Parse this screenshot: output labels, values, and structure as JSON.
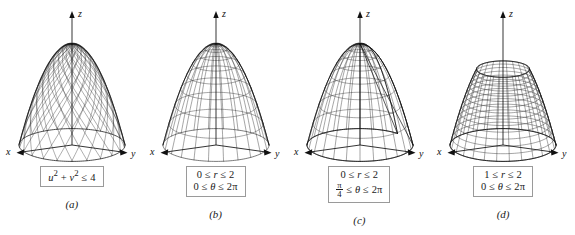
{
  "figure": {
    "background_color": "#ffffff",
    "ink_color": "#1a1a1a",
    "box_border_color": "#9a9a9a"
  },
  "axes": {
    "x_label": "x",
    "y_label": "y",
    "z_label": "z"
  },
  "panels": [
    {
      "id": "a",
      "label": "(a)",
      "surface": "paraboloid dome with diagonal criss-cross mesh, closed top",
      "domain_lines": [
        {
          "parts": [
            {
              "t": "u",
              "style": "italic"
            },
            {
              "t": "2",
              "style": "sup"
            },
            {
              "t": " + ",
              "style": "plain"
            },
            {
              "t": "v",
              "style": "italic"
            },
            {
              "t": "2",
              "style": "sup"
            },
            {
              "t": " ≤ 4",
              "style": "plain"
            }
          ],
          "text": "u² + v² ≤ 4"
        }
      ]
    },
    {
      "id": "b",
      "label": "(b)",
      "surface": "paraboloid dome with rectangular polar grid mesh, closed top",
      "domain_lines": [
        {
          "parts": [
            {
              "t": "0 ≤ ",
              "style": "plain"
            },
            {
              "t": "r",
              "style": "italic"
            },
            {
              "t": " ≤ 2",
              "style": "plain"
            }
          ],
          "text": "0 ≤ r ≤ 2"
        },
        {
          "parts": [
            {
              "t": "0 ≤ ",
              "style": "plain"
            },
            {
              "t": "θ",
              "style": "italic"
            },
            {
              "t": " ≤ 2π",
              "style": "plain"
            }
          ],
          "text": "0 ≤ θ ≤ 2π"
        }
      ]
    },
    {
      "id": "c",
      "label": "(c)",
      "surface": "paraboloid dome with wedge cut out between theta = pi/4 and 2pi, interior visible",
      "domain_lines": [
        {
          "parts": [
            {
              "t": "0 ≤ ",
              "style": "plain"
            },
            {
              "t": "r",
              "style": "italic"
            },
            {
              "t": " ≤ 2",
              "style": "plain"
            }
          ],
          "text": "0 ≤ r ≤ 2"
        },
        {
          "fraction": {
            "num": "π",
            "den": "4"
          },
          "parts": [
            {
              "t": " ≤ ",
              "style": "plain"
            },
            {
              "t": "θ",
              "style": "italic"
            },
            {
              "t": " ≤ 2π",
              "style": "plain"
            }
          ],
          "text": "π/4 ≤ θ ≤ 2π"
        }
      ]
    },
    {
      "id": "d",
      "label": "(d)",
      "surface": "truncated paraboloid annulus with open hole at top, 1 ≤ r ≤ 2",
      "domain_lines": [
        {
          "parts": [
            {
              "t": "1 ≤ ",
              "style": "plain"
            },
            {
              "t": "r",
              "style": "italic"
            },
            {
              "t": " ≤ 2",
              "style": "plain"
            }
          ],
          "text": "1 ≤ r ≤ 2"
        },
        {
          "parts": [
            {
              "t": "0 ≤ ",
              "style": "plain"
            },
            {
              "t": "θ",
              "style": "italic"
            },
            {
              "t": " ≤ 2π",
              "style": "plain"
            }
          ],
          "text": "0 ≤ θ ≤ 2π"
        }
      ]
    }
  ],
  "chart_data": {
    "type": "line",
    "xlabel": "x",
    "ylabel": "y",
    "zlabel": "z",
    "surface_equation": "z = 4 - r²",
    "panels": [
      {
        "id": "a",
        "r_min": 0,
        "r_max": 2,
        "theta_min_deg": 0,
        "theta_max_deg": 360,
        "mesh": "diagonal",
        "domain_text": "u² + v² ≤ 4"
      },
      {
        "id": "b",
        "r_min": 0,
        "r_max": 2,
        "theta_min_deg": 0,
        "theta_max_deg": 360,
        "mesh": "polar-grid",
        "domain_text": "0 ≤ r ≤ 2 ; 0 ≤ θ ≤ 2π"
      },
      {
        "id": "c",
        "r_min": 0,
        "r_max": 2,
        "theta_min_deg": 45,
        "theta_max_deg": 360,
        "mesh": "polar-grid",
        "domain_text": "0 ≤ r ≤ 2 ; π/4 ≤ θ ≤ 2π"
      },
      {
        "id": "d",
        "r_min": 1,
        "r_max": 2,
        "theta_min_deg": 0,
        "theta_max_deg": 360,
        "mesh": "polar-grid",
        "domain_text": "1 ≤ r ≤ 2 ; 0 ≤ θ ≤ 2π"
      }
    ]
  }
}
